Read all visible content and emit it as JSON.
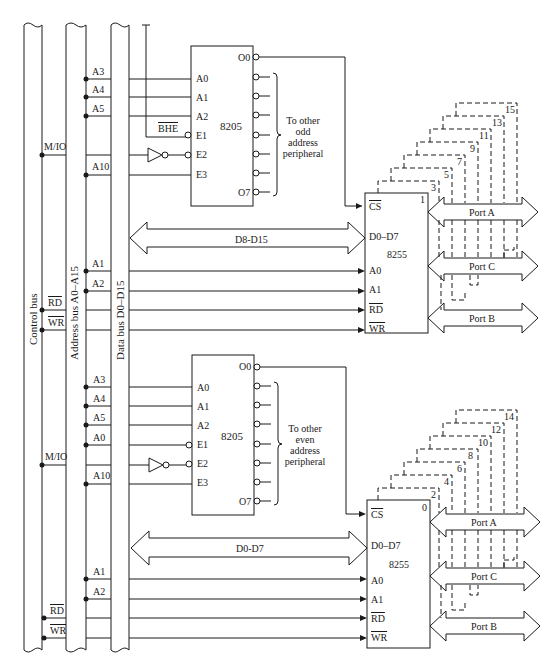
{
  "buses": {
    "control": "Control bus",
    "address": "Address bus A0–A15",
    "data": "Data bus D0–D15"
  },
  "upper": {
    "decoder": {
      "name": "8205",
      "inputs": [
        "A0",
        "A1",
        "A2",
        "E1",
        "E2",
        "E3"
      ],
      "out_first": "O0",
      "out_last": "O7",
      "bus_lines": [
        "A3",
        "A4",
        "A5",
        "BHE",
        "M/IO",
        "A10"
      ],
      "note": [
        "To other",
        "odd",
        "address",
        "peripheral"
      ]
    },
    "ppi": {
      "name": "8255",
      "index": "1",
      "pins": [
        "CS",
        "D0–D7",
        "A0",
        "A1",
        "RD",
        "WR"
      ],
      "data_arrow": "D8-D15",
      "bus_lines": [
        "A1",
        "A2",
        "RD",
        "WR"
      ],
      "ports": [
        "Port A",
        "Port C",
        "Port B"
      ],
      "stack": [
        "3",
        "5",
        "7",
        "9",
        "11",
        "13",
        "15"
      ]
    }
  },
  "lower": {
    "decoder": {
      "name": "8205",
      "inputs": [
        "A0",
        "A1",
        "A2",
        "E1",
        "E2",
        "E3"
      ],
      "out_first": "O0",
      "out_last": "O7",
      "bus_lines": [
        "A3",
        "A4",
        "A5",
        "A0",
        "M/IO",
        "A10"
      ],
      "note": [
        "To other",
        "even",
        "address",
        "peripheral"
      ]
    },
    "ppi": {
      "name": "8255",
      "index": "0",
      "pins": [
        "CS",
        "D0–D7",
        "A0",
        "A1",
        "RD",
        "WR"
      ],
      "data_arrow": "D0-D7",
      "bus_lines": [
        "A1",
        "A2",
        "RD",
        "WR"
      ],
      "ports": [
        "Port A",
        "Port C",
        "Port B"
      ],
      "stack": [
        "2",
        "4",
        "6",
        "8",
        "10",
        "12",
        "14"
      ]
    }
  }
}
